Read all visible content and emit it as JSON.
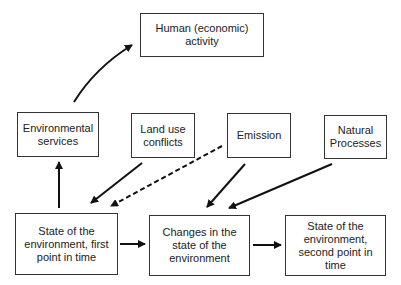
{
  "diagram": {
    "nodes": [
      {
        "id": "human",
        "label": "Human (economic) activity"
      },
      {
        "id": "env_services",
        "label": "Environmental services"
      },
      {
        "id": "land_use",
        "label": "Land use conflicts"
      },
      {
        "id": "emission",
        "label": "Emission"
      },
      {
        "id": "natural",
        "label": "Natural Processes"
      },
      {
        "id": "state_first",
        "label": "State of the environment, first point in time"
      },
      {
        "id": "changes",
        "label": "Changes in the state of the environment"
      },
      {
        "id": "state_second",
        "label": "State of the environment, second point in time"
      }
    ],
    "edges": [
      {
        "from": "env_services",
        "to": "human",
        "style": "solid"
      },
      {
        "from": "state_first",
        "to": "env_services",
        "style": "solid"
      },
      {
        "from": "land_use",
        "to": "state_first",
        "style": "solid"
      },
      {
        "from": "emission",
        "to": "state_first",
        "style": "dashed"
      },
      {
        "from": "emission",
        "to": "changes",
        "style": "solid"
      },
      {
        "from": "natural",
        "to": "changes",
        "style": "solid"
      },
      {
        "from": "state_first",
        "to": "changes",
        "style": "solid"
      },
      {
        "from": "changes",
        "to": "state_second",
        "style": "solid"
      }
    ]
  }
}
